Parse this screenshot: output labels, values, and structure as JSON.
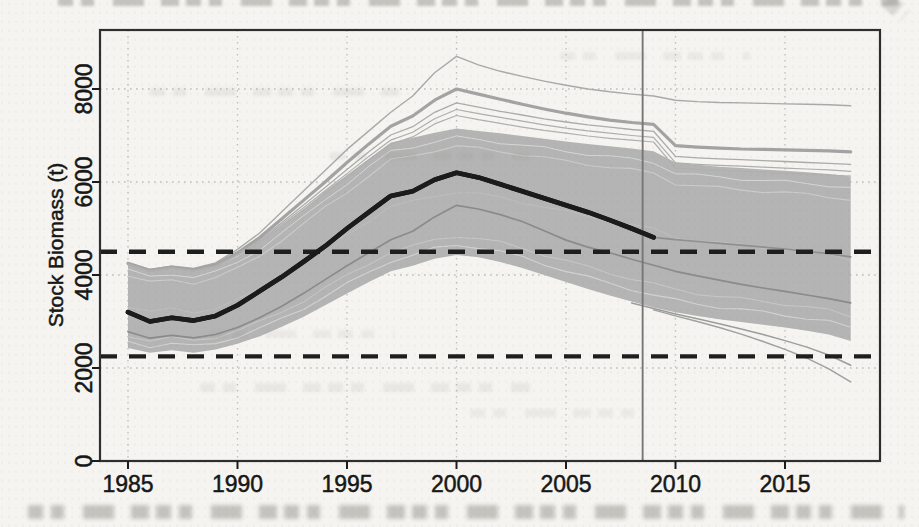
{
  "chart_data": {
    "type": "line",
    "title": "",
    "xlabel": "",
    "ylabel": "Stock Biomass (t)",
    "x_ticks": [
      1985,
      1990,
      1995,
      2000,
      2005,
      2010,
      2015
    ],
    "x_tick_labels": [
      "1985",
      "1990",
      "1995",
      "2000",
      "2005",
      "2010",
      "2015"
    ],
    "y_ticks": [
      0,
      2000,
      4000,
      6000,
      8000
    ],
    "y_tick_labels": [
      "0",
      "2000",
      "4000",
      "6000",
      "8000"
    ],
    "xlim": [
      1983.7,
      2019.4
    ],
    "ylim": [
      0,
      9250
    ],
    "grid": "dotted",
    "reference_lines_dashed": {
      "upper": 4500,
      "lower": 2250
    },
    "vertical_line_year": 2008.5,
    "years": [
      1985,
      1986,
      1987,
      1988,
      1989,
      1990,
      1991,
      1992,
      1993,
      1994,
      1995,
      1996,
      1997,
      1998,
      1999,
      2000,
      2001,
      2002,
      2003,
      2004,
      2005,
      2006,
      2007,
      2008,
      2009,
      2010,
      2011,
      2012,
      2013,
      2014,
      2015,
      2016,
      2017,
      2018
    ],
    "band": {
      "name": "trajectory-envelope",
      "upper": [
        4230,
        4080,
        4150,
        4080,
        4180,
        4400,
        4700,
        5050,
        5400,
        5800,
        6150,
        6500,
        6850,
        6950,
        7060,
        7150,
        7100,
        7050,
        6990,
        6930,
        6870,
        6820,
        6770,
        6720,
        6660,
        6420,
        6370,
        6330,
        6300,
        6270,
        6240,
        6210,
        6170,
        6120
      ],
      "lower": [
        2430,
        2330,
        2380,
        2330,
        2400,
        2520,
        2680,
        2880,
        3100,
        3350,
        3600,
        3850,
        4080,
        4200,
        4350,
        4430,
        4380,
        4280,
        4150,
        4000,
        3850,
        3700,
        3560,
        3430,
        3300,
        3200,
        3120,
        3050,
        2990,
        2930,
        2870,
        2800,
        2720,
        2580
      ]
    },
    "series": [
      {
        "name": "outlier-run-top",
        "color": "#a9a9a9",
        "width": 1.4,
        "values": [
          4270,
          4120,
          4190,
          4140,
          4260,
          4550,
          4900,
          5350,
          5800,
          6250,
          6700,
          7100,
          7500,
          7850,
          8350,
          8700,
          8520,
          8380,
          8270,
          8170,
          8080,
          8000,
          7940,
          7890,
          7850,
          7760,
          7730,
          7710,
          7700,
          7690,
          7680,
          7670,
          7660,
          7640
        ]
      },
      {
        "name": "outlier-run-cluster",
        "color": "#a3a3a3",
        "width": 3.2,
        "values": [
          4250,
          4100,
          4170,
          4110,
          4220,
          4480,
          4800,
          5200,
          5600,
          6000,
          6420,
          6820,
          7200,
          7420,
          7760,
          8000,
          7890,
          7780,
          7670,
          7570,
          7480,
          7400,
          7330,
          7280,
          7240,
          6780,
          6750,
          6730,
          6710,
          6700,
          6690,
          6680,
          6670,
          6650
        ]
      },
      {
        "name": "outlier-run-3",
        "color": "#ababab",
        "width": 1.3,
        "values": [
          4240,
          4090,
          4160,
          4100,
          4200,
          4450,
          4750,
          5120,
          5500,
          5880,
          6270,
          6650,
          7010,
          7190,
          7500,
          7700,
          7610,
          7520,
          7440,
          7360,
          7290,
          7230,
          7180,
          7130,
          7090,
          6550,
          6520,
          6500,
          6480,
          6460,
          6440,
          6420,
          6400,
          6380
        ]
      },
      {
        "name": "outlier-run-4",
        "color": "#aeaeae",
        "width": 1.2,
        "values": [
          4235,
          4085,
          4150,
          4090,
          4190,
          4430,
          4720,
          5080,
          5440,
          5810,
          6180,
          6550,
          6900,
          7070,
          7360,
          7560,
          7470,
          7390,
          7310,
          7230,
          7160,
          7100,
          7050,
          7000,
          6960,
          6410,
          6380,
          6360,
          6340,
          6320,
          6300,
          6280,
          6260,
          6230
        ]
      },
      {
        "name": "outlier-run-5",
        "color": "#b0b0b0",
        "width": 1.2,
        "values": [
          4230,
          4080,
          4150,
          4085,
          4185,
          4420,
          4700,
          5050,
          5400,
          5760,
          6110,
          6470,
          6810,
          6970,
          7250,
          7430,
          7340,
          7260,
          7180,
          7110,
          7050,
          6990,
          6940,
          6900,
          6860,
          6300,
          6270,
          6250,
          6230,
          6210,
          6190,
          6170,
          6150,
          6130
        ]
      },
      {
        "name": "outlier-run-low-1",
        "color": "#9c9c9c",
        "width": 1.5,
        "values": [
          null,
          null,
          null,
          null,
          null,
          null,
          null,
          null,
          null,
          null,
          null,
          null,
          null,
          null,
          null,
          null,
          null,
          null,
          null,
          null,
          null,
          null,
          null,
          3400,
          3280,
          3160,
          3060,
          2950,
          2840,
          2720,
          2590,
          2450,
          2280,
          2060
        ]
      },
      {
        "name": "outlier-run-low-2",
        "color": "#a0a0a0",
        "width": 1.5,
        "values": [
          null,
          null,
          null,
          null,
          null,
          null,
          null,
          null,
          null,
          null,
          null,
          null,
          null,
          null,
          null,
          null,
          null,
          null,
          null,
          null,
          null,
          null,
          null,
          null,
          3250,
          3120,
          3000,
          2870,
          2730,
          2570,
          2400,
          2210,
          1980,
          1700
        ]
      },
      {
        "name": "lower-quantile-line",
        "color": "#8b8b8b",
        "width": 1.7,
        "values": [
          2780,
          2640,
          2700,
          2650,
          2720,
          2870,
          3080,
          3320,
          3600,
          3900,
          4200,
          4480,
          4760,
          4940,
          5250,
          5500,
          5420,
          5300,
          5150,
          4950,
          4750,
          4600,
          4480,
          4340,
          4210,
          4080,
          3980,
          3890,
          3800,
          3720,
          3650,
          3570,
          3490,
          3400
        ]
      },
      {
        "name": "projection-median",
        "color": "#909090",
        "width": 1.7,
        "values": [
          null,
          null,
          null,
          null,
          null,
          null,
          null,
          null,
          null,
          null,
          null,
          null,
          null,
          null,
          null,
          null,
          null,
          null,
          null,
          null,
          null,
          null,
          null,
          null,
          4810,
          4760,
          4720,
          4680,
          4640,
          4600,
          4560,
          4510,
          4460,
          4390
        ]
      },
      {
        "name": "assessment-median",
        "color": "#1b1b1b",
        "width": 4.6,
        "values": [
          3200,
          3000,
          3080,
          3020,
          3120,
          3350,
          3650,
          3950,
          4280,
          4620,
          5000,
          5350,
          5700,
          5800,
          6050,
          6200,
          6100,
          5950,
          5800,
          5650,
          5500,
          5350,
          5180,
          5000,
          4810,
          null,
          null,
          null,
          null,
          null,
          null,
          null,
          null,
          null
        ]
      }
    ],
    "colors": {
      "band_fill": "#b4b4b4",
      "median": "#1b1b1b",
      "reference_dash": "#1e1e1e",
      "vertical_line": "#767676",
      "frame": "#2e2e2e",
      "grid_dots": "#bdbdbd",
      "tick_text": "#171717",
      "page_background": "#f5f4f0"
    }
  }
}
